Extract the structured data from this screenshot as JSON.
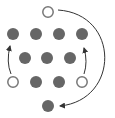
{
  "diagram": {
    "title": "",
    "colors": {
      "filled_coin": "#666666",
      "open_coin_stroke": "#777777",
      "open_coin_fill": "#ffffff",
      "arrow": "#333333",
      "background": "#ffffff"
    },
    "coin_radius": 6,
    "coins": [
      {
        "id": "top",
        "x": 48,
        "y": 12,
        "state": "open"
      },
      {
        "id": "r1c1",
        "x": 13,
        "y": 34,
        "state": "filled"
      },
      {
        "id": "r1c2",
        "x": 36,
        "y": 34,
        "state": "filled"
      },
      {
        "id": "r1c3",
        "x": 59,
        "y": 34,
        "state": "filled"
      },
      {
        "id": "r1c4",
        "x": 82,
        "y": 34,
        "state": "filled"
      },
      {
        "id": "r2c1",
        "x": 25,
        "y": 58,
        "state": "filled"
      },
      {
        "id": "r2c2",
        "x": 47,
        "y": 58,
        "state": "filled"
      },
      {
        "id": "r2c3",
        "x": 70,
        "y": 58,
        "state": "filled"
      },
      {
        "id": "r3c1",
        "x": 13,
        "y": 82,
        "state": "open"
      },
      {
        "id": "r3c2",
        "x": 36,
        "y": 82,
        "state": "filled"
      },
      {
        "id": "r3c3",
        "x": 59,
        "y": 82,
        "state": "filled"
      },
      {
        "id": "r3c4",
        "x": 82,
        "y": 82,
        "state": "open"
      },
      {
        "id": "bottom",
        "x": 48,
        "y": 106,
        "state": "filled"
      }
    ],
    "arrows": [
      {
        "id": "left-move",
        "from": "r3c1",
        "to": "r1c1",
        "path": "M 11 74 Q 6 62 10 46",
        "head": {
          "x": 10,
          "y": 44,
          "dir": "up"
        }
      },
      {
        "id": "right-move",
        "from": "r3c4",
        "to": "r1c4",
        "path": "M 84 74 Q 88 62 84 48",
        "head": {
          "x": 84,
          "y": 44,
          "dir": "up"
        }
      },
      {
        "id": "top-to-bottom-move",
        "from": "top",
        "to": "bottom",
        "path": "M 58 10 C 120 14 120 100 60 106",
        "head": {
          "x": 57,
          "y": 106,
          "dir": "left"
        }
      }
    ]
  }
}
